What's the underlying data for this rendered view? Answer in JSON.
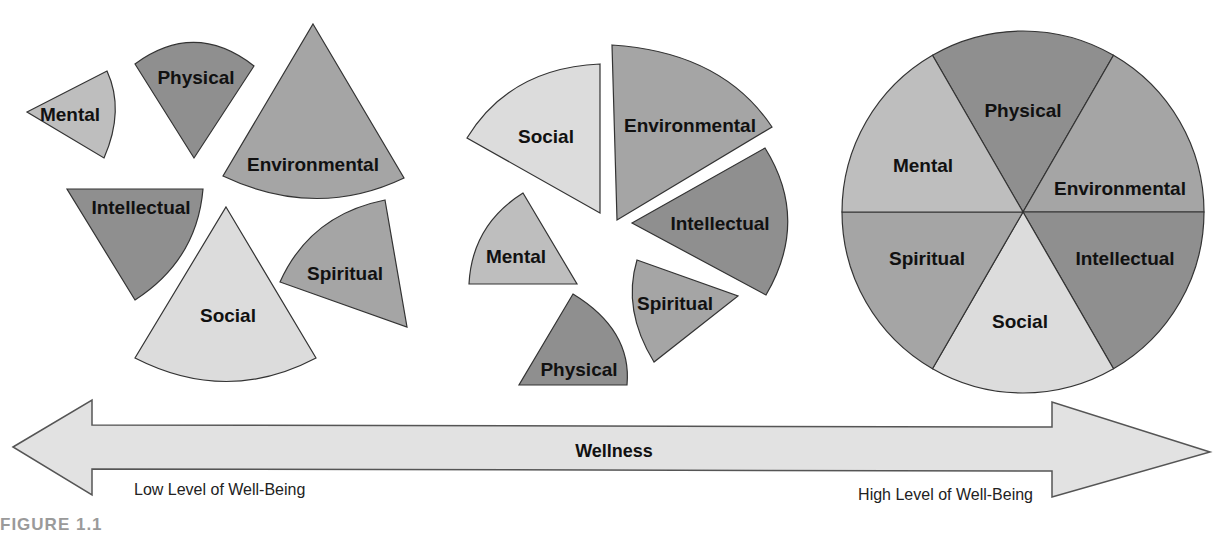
{
  "figure_label": "FIGURE 1.1",
  "colors": {
    "physical": "#8f8f8f",
    "intellectual": "#8f8f8f",
    "environmental": "#a5a5a5",
    "spiritual": "#a5a5a5",
    "mental": "#bebebe",
    "social": "#dcdcdc",
    "arrow_fill": "#e2e2e2",
    "outline": "#333333"
  },
  "diagrams": {
    "scattered": {
      "mental": "Mental",
      "physical": "Physical",
      "environmental": "Environmental",
      "intellectual": "Intellectual",
      "social": "Social",
      "spiritual": "Spiritual"
    },
    "partial": {
      "social": "Social",
      "environmental": "Environmental",
      "intellectual": "Intellectual",
      "mental": "Mental",
      "spiritual": "Spiritual",
      "physical": "Physical"
    },
    "whole": {
      "physical": "Physical",
      "mental": "Mental",
      "environmental": "Environmental",
      "spiritual": "Spiritual",
      "intellectual": "Intellectual",
      "social": "Social"
    }
  },
  "arrow": {
    "title": "Wellness",
    "left_label": "Low Level of Well-Being",
    "right_label": "High Level of Well-Being"
  }
}
